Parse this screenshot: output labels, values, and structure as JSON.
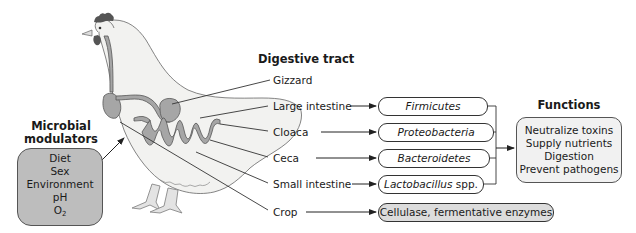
{
  "colors": {
    "modulator_box": "#bdbdbd",
    "function_box": "#f1f1f1",
    "enzyme_pill": "#dcdcdc",
    "chicken_body": "#f2f2f0",
    "gut": "#a6a6a6",
    "comb": "#555555",
    "line": "#333333"
  },
  "modulators": {
    "title_line1": "Microbial",
    "title_line2": "modulators",
    "items": [
      "Diet",
      "Sex",
      "Environment",
      "pH",
      "O"
    ],
    "o2_subscript": "2"
  },
  "digestive_tract": {
    "title": "Digestive tract",
    "organs": [
      {
        "label": "Gizzard"
      },
      {
        "label": "Large intestine",
        "microbe": "Firmicutes"
      },
      {
        "label": "Cloaca",
        "microbe": "Proteobacteria"
      },
      {
        "label": "Ceca",
        "microbe": "Bacteroidetes"
      },
      {
        "label": "Small intestine",
        "microbe": "Lactobacillus",
        "microbe_suffix": " spp."
      },
      {
        "label": "Crop",
        "microbe": "Cellulase, fermentative enzymes"
      }
    ]
  },
  "functions": {
    "title": "Functions",
    "items": [
      "Neutralize toxins",
      "Supply nutrients",
      "Digestion",
      "Prevent pathogens"
    ]
  }
}
